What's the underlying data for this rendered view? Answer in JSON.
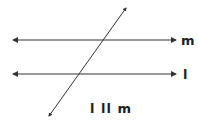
{
  "diagram": {
    "type": "geometry-parallel-lines-transversal",
    "lines": [
      {
        "name": "m",
        "label": "m",
        "y": 40
      },
      {
        "name": "l",
        "label": "l",
        "y": 74
      }
    ],
    "transversal": {
      "from": [
        49,
        116
      ],
      "to": [
        126,
        8
      ]
    },
    "statement": "l ll m",
    "colors": {
      "line": "#333333",
      "background": "#ffffff"
    }
  }
}
